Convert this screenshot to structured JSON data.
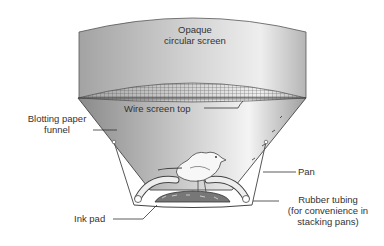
{
  "diagram": {
    "type": "apparatus-illustration",
    "labels": {
      "screen_line1": "Opaque",
      "screen_line2": "circular screen",
      "wire": "Wire screen top",
      "funnel_line1": "Blotting paper",
      "funnel_line2": "funnel",
      "pan": "Pan",
      "tubing_line1": "Rubber tubing",
      "tubing_line2": "(for convenience in",
      "tubing_line3": "stacking pans)",
      "inkpad": "Ink pad"
    },
    "colors": {
      "screen_light": "#e6e6e6",
      "screen_dark": "#9a9a9a",
      "funnel_light": "#f2f2f2",
      "funnel_dark": "#8e8e8e",
      "outline": "#444444",
      "text": "#333333"
    }
  }
}
